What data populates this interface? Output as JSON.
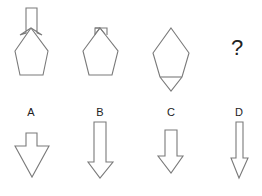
{
  "puzzle": {
    "sequence": [
      {
        "id": "fig1",
        "description": "down-arrow overlapping top of pentagon; shaft above, arrowhead wings at pentagon apex"
      },
      {
        "id": "fig2",
        "description": "pentagon with small rectangle at apex (arrow mostly absorbed)"
      },
      {
        "id": "fig3",
        "description": "pentagon with triangle attached at bottom, divided by horizontal line"
      },
      {
        "id": "fig4",
        "symbol": "?"
      }
    ],
    "question_mark": "?",
    "options": [
      {
        "label": "A",
        "description": "short shaft, wide large triangular arrowhead"
      },
      {
        "label": "B",
        "description": "long shaft, medium arrowhead"
      },
      {
        "label": "C",
        "description": "medium shaft, medium arrowhead"
      },
      {
        "label": "D",
        "description": "long thin shaft, narrow arrowhead"
      }
    ]
  },
  "colors": {
    "stroke": "#7a7a7a",
    "text": "#222222",
    "background": "#ffffff"
  }
}
